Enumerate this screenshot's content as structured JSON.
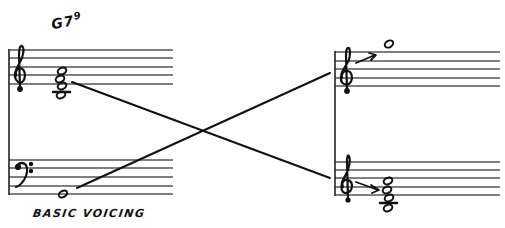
{
  "diagram": {
    "type": "music-notation-voicing-diagram",
    "chord_symbol": {
      "root": "G",
      "extensions": "7",
      "superscript": "9"
    },
    "caption": "BASIC VOICING",
    "left_system": {
      "treble_staff": {
        "clef": "treble",
        "content": "stacked chord (4 notes)"
      },
      "bass_staff": {
        "clef": "bass",
        "content": "single whole note below staff"
      }
    },
    "right_system": {
      "top_staff": {
        "clef": "treble",
        "content": "single whole note above staff",
        "arrow": "up-right"
      },
      "bottom_staff": {
        "clef": "treble",
        "content": "stacked chord (4 notes)",
        "arrow": "right"
      }
    },
    "connectors": [
      {
        "from": "left treble chord",
        "to": "right bottom staff"
      },
      {
        "from": "left bass note",
        "to": "right top staff"
      }
    ],
    "colors": {
      "ink": "#111111",
      "staff_line": "#555555",
      "background": "#ffffff"
    }
  }
}
